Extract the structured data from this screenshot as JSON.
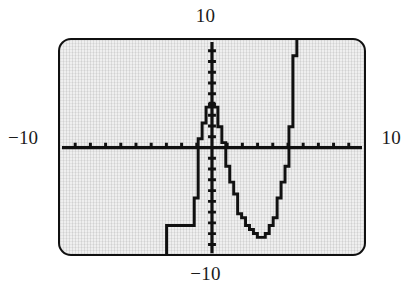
{
  "device": {
    "kind": "graphing-calculator-screen",
    "screen_background": "#efefef",
    "trace_color": "#111111",
    "bezel_color": "#101010"
  },
  "labels": {
    "top": "10",
    "bottom": "−10",
    "left": "−10",
    "right": "10"
  },
  "chart_data": {
    "type": "line",
    "title": "",
    "subtitle": "",
    "xlabel": "",
    "ylabel": "",
    "xlim": [
      -10,
      10
    ],
    "ylim": [
      -10,
      10
    ],
    "xticks": [
      -9,
      -8,
      -7,
      -6,
      -5,
      -4,
      -3,
      -2,
      -1,
      1,
      2,
      3,
      4,
      5,
      6,
      7,
      8,
      9
    ],
    "yticks": [
      -9,
      -8,
      -7,
      -6,
      -5,
      -4,
      -3,
      -2,
      -1,
      1,
      2,
      3,
      4,
      5,
      6,
      7,
      8,
      9
    ],
    "tick_label_text": [],
    "grid": false,
    "legend": null,
    "axes_shown": [
      "x-axis",
      "y-axis"
    ],
    "rendering": "pixelated-staircase",
    "corner_labels": {
      "xmin": "−10",
      "xmax": "10",
      "ymin": "−10",
      "ymax": "10"
    },
    "series": [
      {
        "name": "y",
        "x": [
          -3.1,
          -3.05,
          -3.0,
          -2.9,
          -2.8,
          -2.7,
          -2.6,
          -2.5,
          -2.4,
          -2.3,
          -2.2,
          -2.1,
          -2.0,
          -1.9,
          -1.8,
          -1.7,
          -1.6,
          -1.5,
          -1.4,
          -1.3,
          -1.2,
          -1.1,
          -1.0,
          -0.9,
          -0.8,
          -0.7,
          -0.6,
          -0.5,
          -0.4,
          -0.3,
          -0.2,
          -0.1,
          0.0,
          0.1,
          0.2,
          0.3,
          0.4,
          0.5,
          0.6,
          0.7,
          0.8,
          0.9,
          1.0,
          1.2,
          1.4,
          1.6,
          1.8,
          2.0,
          2.2,
          2.4,
          2.6,
          2.8,
          3.0,
          3.2,
          3.4,
          3.6,
          3.8,
          4.0,
          4.2,
          4.4,
          4.6,
          4.8,
          5.0,
          5.1,
          5.2,
          5.3,
          5.4,
          5.5
        ],
        "y": [
          -10.0,
          -8.6,
          -7.2,
          -7.2,
          -7.2,
          -7.2,
          -7.2,
          -7.2,
          -7.2,
          -7.2,
          -7.2,
          -7.2,
          -7.2,
          -7.2,
          -7.2,
          -7.2,
          -7.2,
          -7.2,
          -7.2,
          -7.2,
          -6.2,
          -4.6,
          -2.6,
          -0.4,
          0.7,
          1.6,
          2.3,
          2.9,
          3.4,
          3.8,
          4.05,
          4.2,
          4.25,
          4.1,
          3.8,
          3.35,
          2.8,
          2.1,
          1.35,
          0.55,
          -0.3,
          -1.1,
          -1.9,
          -3.3,
          -4.4,
          -5.3,
          -6.0,
          -6.6,
          -7.1,
          -7.55,
          -7.9,
          -8.15,
          -8.3,
          -8.3,
          -8.15,
          -7.8,
          -7.3,
          -6.6,
          -5.7,
          -4.6,
          -3.3,
          -1.8,
          -0.1,
          1.8,
          4.0,
          6.4,
          8.6,
          10.0
        ]
      }
    ],
    "features": {
      "local_maximum": {
        "x": 0.0,
        "y": 4.25
      },
      "local_minimum": {
        "x": 3.1,
        "y": -8.3
      },
      "x_intercepts": [
        -0.95,
        0.75,
        5.0
      ]
    }
  }
}
